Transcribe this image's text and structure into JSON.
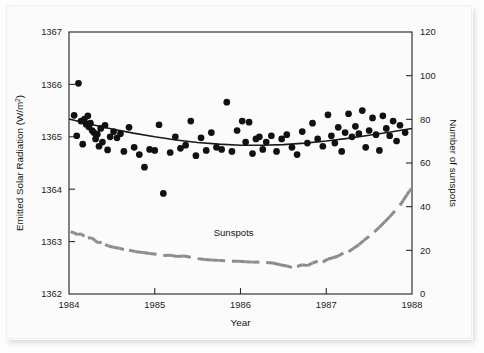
{
  "figure": {
    "background_color": "#fbfbfb",
    "frame_color": "#2a2a2a",
    "scatter_color": "#111111",
    "trend_color": "#1a1a1a",
    "sunspot_color": "#8c8c8c"
  },
  "chart_data": {
    "type": "scatter",
    "title": "",
    "xlabel": "Year",
    "ylabel": "Emitted Solar Radiation (W/m²)",
    "y2label": "Number of sunspots",
    "xlim": [
      1984,
      1988
    ],
    "ylim": [
      1362,
      1367
    ],
    "y2lim": [
      0,
      120
    ],
    "xticks": [
      1984,
      1985,
      1986,
      1987,
      1988
    ],
    "xticklabels": [
      "1984",
      "1985",
      "1986",
      "1987",
      "1988"
    ],
    "yticks": [
      1362,
      1363,
      1364,
      1365,
      1366,
      1367
    ],
    "yticklabels": [
      "1362",
      "1363",
      "1364",
      "1365",
      "1366",
      "1367"
    ],
    "y2ticks": [
      0,
      20,
      40,
      60,
      80,
      100,
      120
    ],
    "y2ticklabels": [
      "0",
      "20",
      "40",
      "60",
      "80",
      "100",
      "120"
    ],
    "grid": false,
    "legend_position": "inline-annotation",
    "annotations": [
      {
        "text": "Sunspots",
        "x": 1985.92,
        "y2": 26.5,
        "name": "sunspots-label"
      }
    ],
    "series": [
      {
        "name": "Emitted Solar Radiation",
        "type": "scatter",
        "axis": "left",
        "marker": "filled-circle",
        "marker_size": 5.2,
        "color": "#111111",
        "points": [
          [
            1984.06,
            1365.41
          ],
          [
            1984.09,
            1365.02
          ],
          [
            1984.11,
            1366.02
          ],
          [
            1984.14,
            1365.3
          ],
          [
            1984.16,
            1364.86
          ],
          [
            1984.18,
            1365.34
          ],
          [
            1984.2,
            1365.24
          ],
          [
            1984.22,
            1365.4
          ],
          [
            1984.23,
            1365.19
          ],
          [
            1984.25,
            1365.26
          ],
          [
            1984.27,
            1365.12
          ],
          [
            1984.29,
            1365.08
          ],
          [
            1984.31,
            1364.96
          ],
          [
            1984.33,
            1365.05
          ],
          [
            1984.35,
            1364.82
          ],
          [
            1984.37,
            1365.16
          ],
          [
            1984.39,
            1364.9
          ],
          [
            1984.42,
            1365.22
          ],
          [
            1984.45,
            1364.75
          ],
          [
            1984.48,
            1365.0
          ],
          [
            1984.52,
            1365.1
          ],
          [
            1984.56,
            1364.98
          ],
          [
            1984.6,
            1365.06
          ],
          [
            1984.64,
            1364.72
          ],
          [
            1984.7,
            1365.18
          ],
          [
            1984.76,
            1364.8
          ],
          [
            1984.82,
            1364.66
          ],
          [
            1984.88,
            1364.42
          ],
          [
            1984.94,
            1364.76
          ],
          [
            1985.0,
            1364.74
          ],
          [
            1985.05,
            1365.23
          ],
          [
            1985.1,
            1363.92
          ],
          [
            1985.18,
            1364.7
          ],
          [
            1985.24,
            1365.0
          ],
          [
            1985.3,
            1364.78
          ],
          [
            1985.36,
            1364.84
          ],
          [
            1985.42,
            1365.3
          ],
          [
            1985.48,
            1364.64
          ],
          [
            1985.54,
            1364.98
          ],
          [
            1985.6,
            1364.74
          ],
          [
            1985.66,
            1365.08
          ],
          [
            1985.72,
            1364.8
          ],
          [
            1985.78,
            1364.76
          ],
          [
            1985.84,
            1365.66
          ],
          [
            1985.9,
            1364.72
          ],
          [
            1985.96,
            1365.12
          ],
          [
            1986.02,
            1365.3
          ],
          [
            1986.06,
            1364.9
          ],
          [
            1986.1,
            1365.28
          ],
          [
            1986.14,
            1364.68
          ],
          [
            1986.18,
            1364.96
          ],
          [
            1986.22,
            1365.0
          ],
          [
            1986.26,
            1364.76
          ],
          [
            1986.3,
            1364.9
          ],
          [
            1986.36,
            1365.02
          ],
          [
            1986.42,
            1364.72
          ],
          [
            1986.48,
            1364.96
          ],
          [
            1986.54,
            1365.04
          ],
          [
            1986.6,
            1364.8
          ],
          [
            1986.66,
            1364.66
          ],
          [
            1986.72,
            1365.1
          ],
          [
            1986.78,
            1364.88
          ],
          [
            1986.84,
            1365.26
          ],
          [
            1986.9,
            1364.96
          ],
          [
            1986.96,
            1364.82
          ],
          [
            1987.02,
            1365.42
          ],
          [
            1987.06,
            1365.02
          ],
          [
            1987.1,
            1364.88
          ],
          [
            1987.14,
            1365.18
          ],
          [
            1987.18,
            1364.72
          ],
          [
            1987.22,
            1365.08
          ],
          [
            1987.26,
            1365.44
          ],
          [
            1987.3,
            1365.0
          ],
          [
            1987.34,
            1365.2
          ],
          [
            1987.38,
            1365.06
          ],
          [
            1987.42,
            1365.5
          ],
          [
            1987.46,
            1364.8
          ],
          [
            1987.5,
            1365.12
          ],
          [
            1987.54,
            1365.36
          ],
          [
            1987.58,
            1365.04
          ],
          [
            1987.62,
            1364.74
          ],
          [
            1987.66,
            1365.4
          ],
          [
            1987.7,
            1365.16
          ],
          [
            1987.74,
            1365.02
          ],
          [
            1987.78,
            1365.3
          ],
          [
            1987.82,
            1364.92
          ],
          [
            1987.86,
            1365.22
          ],
          [
            1987.92,
            1365.08
          ]
        ]
      },
      {
        "name": "Trend",
        "type": "line",
        "axis": "left",
        "color": "#1a1a1a",
        "line_width": 1.6,
        "points": [
          [
            1984.0,
            1365.34
          ],
          [
            1984.25,
            1365.24
          ],
          [
            1984.5,
            1365.15
          ],
          [
            1984.75,
            1365.07
          ],
          [
            1985.0,
            1365.0
          ],
          [
            1985.25,
            1364.94
          ],
          [
            1985.5,
            1364.89
          ],
          [
            1985.75,
            1364.86
          ],
          [
            1986.0,
            1364.84
          ],
          [
            1986.25,
            1364.84
          ],
          [
            1986.5,
            1364.85
          ],
          [
            1986.75,
            1364.88
          ],
          [
            1987.0,
            1364.92
          ],
          [
            1987.25,
            1364.97
          ],
          [
            1987.5,
            1365.03
          ],
          [
            1987.75,
            1365.09
          ],
          [
            1988.0,
            1365.16
          ]
        ]
      },
      {
        "name": "Sunspots",
        "type": "line",
        "axis": "right",
        "color": "#8c8c8c",
        "line_width": 3.0,
        "style": "thick-dashed",
        "points": [
          [
            1984.02,
            28.5
          ],
          [
            1984.06,
            28.0
          ],
          [
            1984.1,
            27.2
          ],
          [
            1984.14,
            27.6
          ],
          [
            1984.18,
            26.4
          ],
          [
            1984.22,
            25.6
          ],
          [
            1984.26,
            25.8
          ],
          [
            1984.3,
            24.6
          ],
          [
            1984.34,
            23.4
          ],
          [
            1984.38,
            23.8
          ],
          [
            1984.42,
            22.6
          ],
          [
            1984.46,
            22.0
          ],
          [
            1984.52,
            21.4
          ],
          [
            1984.58,
            21.0
          ],
          [
            1984.64,
            20.4
          ],
          [
            1984.7,
            20.0
          ],
          [
            1984.78,
            19.4
          ],
          [
            1984.86,
            19.0
          ],
          [
            1984.94,
            18.6
          ],
          [
            1985.02,
            18.2
          ],
          [
            1985.1,
            17.6
          ],
          [
            1985.18,
            17.8
          ],
          [
            1985.26,
            17.2
          ],
          [
            1985.34,
            17.4
          ],
          [
            1985.42,
            16.8
          ],
          [
            1985.5,
            16.2
          ],
          [
            1985.58,
            15.8
          ],
          [
            1985.66,
            15.6
          ],
          [
            1985.74,
            15.4
          ],
          [
            1985.82,
            15.2
          ],
          [
            1985.9,
            15.0
          ],
          [
            1985.98,
            15.0
          ],
          [
            1986.06,
            14.8
          ],
          [
            1986.14,
            14.6
          ],
          [
            1986.22,
            14.6
          ],
          [
            1986.3,
            14.4
          ],
          [
            1986.38,
            14.2
          ],
          [
            1986.46,
            13.4
          ],
          [
            1986.54,
            12.8
          ],
          [
            1986.6,
            12.2
          ],
          [
            1986.66,
            12.6
          ],
          [
            1986.72,
            13.4
          ],
          [
            1986.78,
            13.0
          ],
          [
            1986.84,
            14.2
          ],
          [
            1986.9,
            15.0
          ],
          [
            1986.96,
            14.6
          ],
          [
            1987.02,
            16.0
          ],
          [
            1987.08,
            16.6
          ],
          [
            1987.14,
            17.4
          ],
          [
            1987.2,
            18.8
          ],
          [
            1987.26,
            19.4
          ],
          [
            1987.32,
            21.0
          ],
          [
            1987.38,
            22.6
          ],
          [
            1987.44,
            24.6
          ],
          [
            1987.5,
            26.4
          ],
          [
            1987.56,
            28.4
          ],
          [
            1987.62,
            30.6
          ],
          [
            1987.68,
            33.0
          ],
          [
            1987.74,
            35.4
          ],
          [
            1987.8,
            38.0
          ],
          [
            1987.86,
            40.6
          ],
          [
            1987.9,
            43.0
          ],
          [
            1987.94,
            45.4
          ],
          [
            1987.97,
            47.2
          ],
          [
            1988.0,
            48.2
          ]
        ]
      }
    ]
  }
}
